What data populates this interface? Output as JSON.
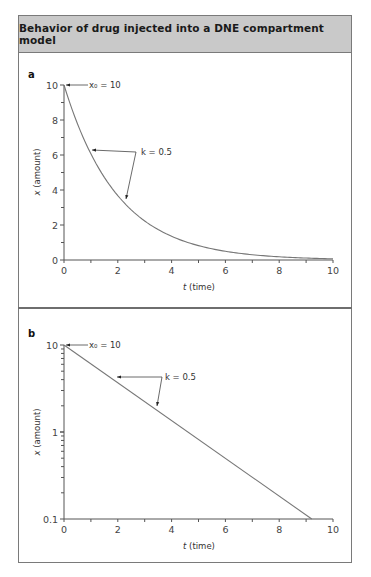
{
  "title": "Behavior of drug injected into a DNE compartment model",
  "panels": [
    {
      "label": "a",
      "xlabel_var": "t",
      "xlabel_rest": " (time)",
      "ylabel_var": "x",
      "ylabel_rest": " (amount)",
      "x_ticks": [
        "0",
        "2",
        "4",
        "6",
        "8",
        "10"
      ],
      "y_ticks": [
        "0",
        "2",
        "4",
        "6",
        "8",
        "10"
      ],
      "annotation_x0": "x₀ = 10",
      "annotation_k": "k = 0.5"
    },
    {
      "label": "b",
      "xlabel_var": "t",
      "xlabel_rest": " (time)",
      "ylabel_var": "x",
      "ylabel_rest": " (amount)",
      "x_ticks": [
        "0",
        "2",
        "4",
        "6",
        "8",
        "10"
      ],
      "y_ticks": [
        "0.1",
        "1",
        "10"
      ],
      "annotation_x0": "x₀ = 10",
      "annotation_k": "k = 0.5"
    }
  ],
  "chart_data": [
    {
      "type": "line",
      "panel": "a",
      "title": "Behavior of drug injected into a DNE compartment model",
      "xlabel": "t (time)",
      "ylabel": "x (amount)",
      "xlim": [
        0,
        10
      ],
      "ylim": [
        0,
        10
      ],
      "yscale": "linear",
      "grid": false,
      "series": [
        {
          "name": "x(t) = 10·e^(-0.5t)",
          "x": [
            0,
            1,
            2,
            3,
            4,
            5,
            6,
            7,
            8,
            9,
            10
          ],
          "values": [
            10,
            6.07,
            3.68,
            2.23,
            1.35,
            0.82,
            0.5,
            0.3,
            0.18,
            0.11,
            0.07
          ]
        }
      ],
      "annotations": [
        "x0 = 10",
        "k = 0.5"
      ]
    },
    {
      "type": "line",
      "panel": "b",
      "title": "Behavior of drug injected into a DNE compartment model",
      "xlabel": "t (time)",
      "ylabel": "x (amount)",
      "xlim": [
        0,
        10
      ],
      "ylim": [
        0.1,
        10
      ],
      "yscale": "log",
      "grid": false,
      "series": [
        {
          "name": "x(t) = 10·e^(-0.5t)",
          "x": [
            0,
            2,
            4,
            6,
            8,
            9.2
          ],
          "values": [
            10,
            3.68,
            1.35,
            0.5,
            0.18,
            0.1
          ]
        }
      ],
      "annotations": [
        "x0 = 10",
        "k = 0.5"
      ]
    }
  ]
}
